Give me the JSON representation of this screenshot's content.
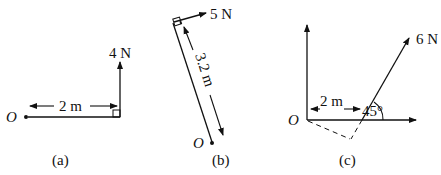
{
  "figure": {
    "panels": [
      {
        "id": "a",
        "caption": "(a)",
        "origin_label": "O",
        "distance_label": "2 m",
        "force_label": "4 N"
      },
      {
        "id": "b",
        "caption": "(b)",
        "origin_label": "O",
        "distance_label": "3.2 m",
        "force_label": "5 N"
      },
      {
        "id": "c",
        "caption": "(c)",
        "origin_label": "O",
        "distance_label": "2 m",
        "force_label": "6 N",
        "angle_label": "45°"
      }
    ]
  },
  "colors": {
    "ink": "#111111",
    "background": "#ffffff"
  }
}
